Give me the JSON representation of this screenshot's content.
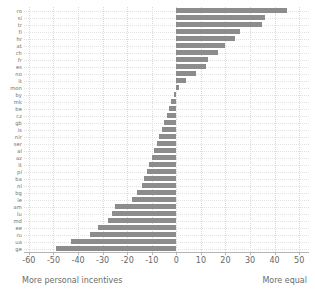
{
  "chart_data": {
    "type": "bar",
    "orientation": "horizontal",
    "title": "",
    "subtitle": "",
    "xlabel": "",
    "ylabel": "",
    "xlim": [
      -62,
      54
    ],
    "ylim": null,
    "grid": true,
    "legend": null,
    "bar_color": "#8c8c8c",
    "zero_line": 0,
    "categories": [
      "ro",
      "si",
      "tr",
      "fi",
      "hr",
      "at",
      "ch",
      "fr",
      "es",
      "no",
      "it",
      "mon",
      "by",
      "mk",
      "be",
      "cz",
      "gb",
      "is",
      "nir",
      "ser",
      "al",
      "az",
      "lt",
      "pl",
      "ba",
      "nl",
      "bg",
      "ie",
      "am",
      "lu",
      "md",
      "ee",
      "ru",
      "ua",
      "ge"
    ],
    "values": [
      45,
      36,
      35,
      26,
      24,
      20,
      17,
      13,
      12,
      8,
      4,
      1,
      -1,
      -2,
      -3,
      -4,
      -5,
      -6,
      -7,
      -8,
      -9,
      -10,
      -11,
      -12,
      -13,
      -14,
      -16,
      -18,
      -25,
      -26,
      -28,
      -32,
      -35,
      -43,
      -49
    ],
    "x_ticks": [
      -60,
      -50,
      -40,
      -30,
      -20,
      -10,
      0,
      10,
      20,
      30,
      40,
      50
    ],
    "x_tick_labels": [
      "-60",
      "-50",
      "-40",
      "-30",
      "-20",
      "-10",
      "0",
      "10",
      "20",
      "30",
      "40",
      "50"
    ],
    "annotations": {
      "left_caption": "More personal incentives",
      "right_caption": "More equal"
    }
  }
}
